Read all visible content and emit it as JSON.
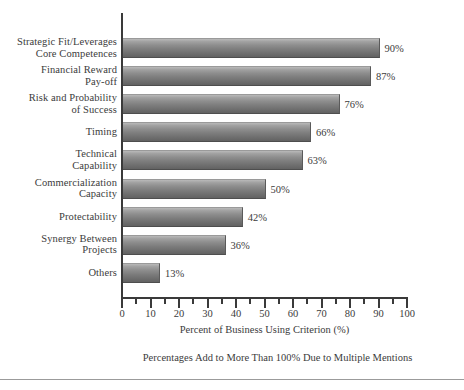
{
  "chart_data": {
    "type": "bar",
    "orientation": "horizontal",
    "title": "",
    "xlabel": "Percent of Business Using Criterion (%)",
    "ylabel": "",
    "xlim": [
      0,
      100
    ],
    "xticks": [
      0,
      10,
      20,
      30,
      40,
      50,
      60,
      70,
      80,
      90,
      100
    ],
    "xtick_labels": [
      "0",
      "10",
      "20",
      "30",
      "40",
      "50",
      "60",
      "70",
      "80",
      "90",
      "100"
    ],
    "minor_tick_interval": 5,
    "grid": false,
    "legend": null,
    "categories": [
      "Strategic Fit/Leverages\nCore Competences",
      "Financial Reward\nPay-off",
      "Risk and Probability\nof Success",
      "Timing",
      "Technical\nCapability",
      "Commercialization\nCapacity",
      "Protectability",
      "Synergy Between\nProjects",
      "Others"
    ],
    "values": [
      90,
      87,
      76,
      66,
      63,
      50,
      42,
      36,
      13
    ],
    "value_labels": [
      "90%",
      "87%",
      "76%",
      "66%",
      "63%",
      "50%",
      "42%",
      "36%",
      "13%"
    ],
    "annotation": "Percentages Add to More Than 100% Due to Multiple Mentions",
    "bar_color_top": "#b9b9b9",
    "bar_color_bottom": "#626262",
    "axis_color": "#3a3a3a",
    "text_color": "#3b3b3b"
  }
}
